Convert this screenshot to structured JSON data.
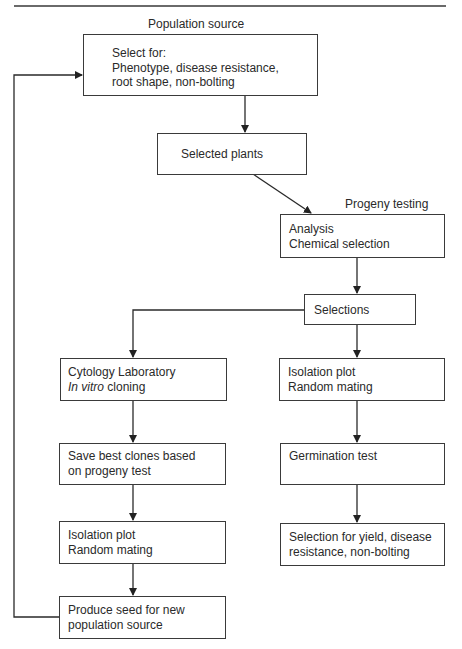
{
  "diagram": {
    "type": "flowchart",
    "labels": {
      "population_source": "Population source",
      "progeny_testing": "Progeny testing"
    },
    "boxes": {
      "select_for": {
        "lines": [
          "Select for:",
          "Phenotype, disease resistance,",
          "root shape, non-bolting"
        ]
      },
      "selected_plants": {
        "lines": [
          "Selected plants"
        ]
      },
      "analysis": {
        "lines": [
          "Analysis",
          "Chemical selection"
        ]
      },
      "selections": {
        "lines": [
          "Selections"
        ]
      },
      "cytology": {
        "line1": "Cytology Laboratory",
        "line2_italic": "In vitro",
        "line2_rest": " cloning"
      },
      "isolation_right": {
        "lines": [
          "Isolation plot",
          "Random mating"
        ]
      },
      "save_clones": {
        "lines": [
          "Save best clones based",
          "on progeny test"
        ]
      },
      "germination": {
        "lines": [
          "Germination test"
        ]
      },
      "isolation_left": {
        "lines": [
          "Isolation plot",
          "Random mating"
        ]
      },
      "selection_yield": {
        "lines": [
          "Selection for yield, disease",
          "resistance, non-bolting"
        ]
      },
      "produce_seed": {
        "lines": [
          "Produce seed for new",
          "population source"
        ]
      }
    },
    "edges": [
      {
        "from": "select_for",
        "to": "selected_plants"
      },
      {
        "from": "selected_plants",
        "to": "analysis"
      },
      {
        "from": "analysis",
        "to": "selections"
      },
      {
        "from": "selections",
        "to": "cytology"
      },
      {
        "from": "selections",
        "to": "isolation_right"
      },
      {
        "from": "cytology",
        "to": "save_clones"
      },
      {
        "from": "isolation_right",
        "to": "germination"
      },
      {
        "from": "save_clones",
        "to": "isolation_left"
      },
      {
        "from": "germination",
        "to": "selection_yield"
      },
      {
        "from": "isolation_left",
        "to": "produce_seed"
      },
      {
        "from": "produce_seed",
        "to": "select_for",
        "note": "feedback loop"
      }
    ]
  }
}
